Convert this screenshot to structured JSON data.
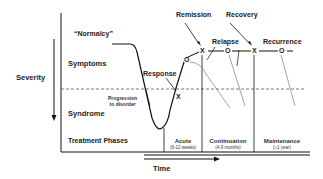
{
  "axis": {
    "y_label": "Severity",
    "x_label": "Time"
  },
  "states": {
    "normalcy": "“Normalcy”",
    "symptoms": "Symptoms",
    "syndrome": "Syndrome",
    "treatment_phases": "Treatment Phases"
  },
  "annotations": {
    "progression": "Progression to disorder",
    "progression_line1": "Progression",
    "progression_line2": "to disorder",
    "response": "Response",
    "remission": "Remission",
    "recovery": "Recovery",
    "relapse": "Relapse",
    "recurrence": "Recurrence"
  },
  "phases": [
    {
      "name": "Acute",
      "duration": "(6-12 weeks)"
    },
    {
      "name": "Continuation",
      "duration": "(4-9 months)"
    },
    {
      "name": "Maintenance",
      "duration": "(≥1 year)"
    }
  ],
  "markers": {
    "x": "X",
    "o": "O"
  },
  "colors": {
    "line": "#111111",
    "dashed": "#555555",
    "thin": "#666666"
  }
}
